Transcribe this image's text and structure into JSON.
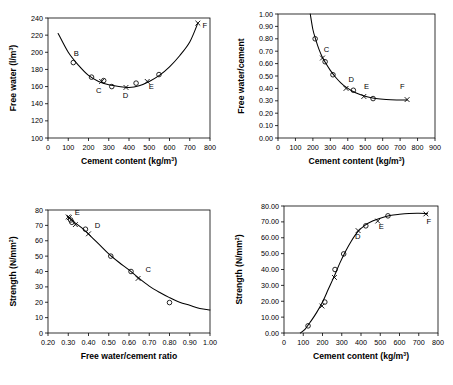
{
  "figure": {
    "panel_count": 4,
    "background": "#ffffff",
    "ink": "#000000"
  },
  "chart_data": [
    {
      "id": "panel-top-left",
      "type": "scatter",
      "title": "",
      "xlabel": "Cement content (kg/m3)",
      "xlabel_base": "Cement content (kg/m",
      "xlabel_sup": "3",
      "xlabel_tail": ")",
      "ylabel": "Free water (l/m3)",
      "ylabel_base": "Free water (l/m",
      "ylabel_sup": "3",
      "ylabel_tail": ")",
      "xlim": [
        0,
        800
      ],
      "ylim": [
        100,
        240
      ],
      "xticks": [
        0,
        100,
        200,
        300,
        400,
        500,
        600,
        700,
        800
      ],
      "xtick_labels": [
        "0",
        "100",
        "200",
        "300",
        "400",
        "500",
        "600",
        "700",
        "800"
      ],
      "yticks": [
        100,
        120,
        140,
        160,
        180,
        200,
        220,
        240
      ],
      "ytick_labels": [
        "100",
        "120",
        "140",
        "160",
        "180",
        "200",
        "220",
        "240"
      ],
      "grid": false,
      "legend": "none",
      "series": [
        {
          "name": "measured",
          "marker": "circle",
          "points": [
            {
              "x": 125,
              "y": 188
            },
            {
              "x": 215,
              "y": 171
            },
            {
              "x": 275,
              "y": 167
            },
            {
              "x": 315,
              "y": 160
            },
            {
              "x": 435,
              "y": 164
            },
            {
              "x": 548,
              "y": 174
            }
          ]
        },
        {
          "name": "design",
          "marker": "cross",
          "points": [
            {
              "x": 265,
              "y": 166
            },
            {
              "x": 385,
              "y": 159
            },
            {
              "x": 490,
              "y": 166
            },
            {
              "x": 740,
              "y": 234
            }
          ]
        }
      ],
      "fit_curve": [
        {
          "x": 50,
          "y": 222
        },
        {
          "x": 100,
          "y": 200
        },
        {
          "x": 150,
          "y": 185
        },
        {
          "x": 200,
          "y": 173
        },
        {
          "x": 250,
          "y": 166
        },
        {
          "x": 300,
          "y": 162
        },
        {
          "x": 350,
          "y": 160
        },
        {
          "x": 400,
          "y": 159
        },
        {
          "x": 450,
          "y": 161
        },
        {
          "x": 500,
          "y": 166
        },
        {
          "x": 550,
          "y": 173
        },
        {
          "x": 600,
          "y": 183
        },
        {
          "x": 650,
          "y": 196
        },
        {
          "x": 700,
          "y": 212
        },
        {
          "x": 740,
          "y": 234
        }
      ],
      "annotations": [
        {
          "text": "B",
          "x": 140,
          "y": 196
        },
        {
          "text": "C",
          "x": 250,
          "y": 152
        },
        {
          "text": "D",
          "x": 383,
          "y": 147
        },
        {
          "text": "E",
          "x": 510,
          "y": 157
        },
        {
          "text": "F",
          "x": 775,
          "y": 228
        }
      ]
    },
    {
      "id": "panel-top-right",
      "type": "scatter",
      "title": "",
      "xlabel": "Cement content (kg/m3)",
      "xlabel_base": "Cement content (kg/m",
      "xlabel_sup": "3",
      "xlabel_tail": ")",
      "ylabel": "Free water/cement",
      "xlim": [
        0,
        900
      ],
      "ylim": [
        0.0,
        1.0
      ],
      "xticks": [
        0,
        100,
        200,
        300,
        400,
        500,
        600,
        700,
        800,
        900
      ],
      "xtick_labels": [
        "0",
        "100",
        "200",
        "300",
        "400",
        "500",
        "600",
        "700",
        "800",
        "900"
      ],
      "yticks": [
        0.0,
        0.1,
        0.2,
        0.3,
        0.4,
        0.5,
        0.6,
        0.7,
        0.8,
        0.9,
        1.0
      ],
      "ytick_labels": [
        "0.00",
        "0.10",
        "0.20",
        "0.30",
        "0.40",
        "0.50",
        "0.60",
        "0.70",
        "0.80",
        "0.90",
        "1.00"
      ],
      "grid": false,
      "legend": "none",
      "series": [
        {
          "name": "measured",
          "marker": "circle",
          "points": [
            {
              "x": 213,
              "y": 0.8
            },
            {
              "x": 270,
              "y": 0.615
            },
            {
              "x": 315,
              "y": 0.51
            },
            {
              "x": 432,
              "y": 0.385
            },
            {
              "x": 545,
              "y": 0.318
            }
          ]
        },
        {
          "name": "design",
          "marker": "cross",
          "points": [
            {
              "x": 255,
              "y": 0.645
            },
            {
              "x": 390,
              "y": 0.4
            },
            {
              "x": 492,
              "y": 0.335
            },
            {
              "x": 740,
              "y": 0.31
            }
          ]
        }
      ],
      "fit_curve": [
        {
          "x": 185,
          "y": 1.0
        },
        {
          "x": 200,
          "y": 0.875
        },
        {
          "x": 215,
          "y": 0.8
        },
        {
          "x": 235,
          "y": 0.715
        },
        {
          "x": 255,
          "y": 0.65
        },
        {
          "x": 275,
          "y": 0.6
        },
        {
          "x": 300,
          "y": 0.545
        },
        {
          "x": 330,
          "y": 0.49
        },
        {
          "x": 360,
          "y": 0.445
        },
        {
          "x": 390,
          "y": 0.41
        },
        {
          "x": 430,
          "y": 0.375
        },
        {
          "x": 470,
          "y": 0.35
        },
        {
          "x": 510,
          "y": 0.332
        },
        {
          "x": 560,
          "y": 0.318
        },
        {
          "x": 620,
          "y": 0.31
        },
        {
          "x": 680,
          "y": 0.307
        },
        {
          "x": 740,
          "y": 0.307
        }
      ],
      "annotations": [
        {
          "text": "C",
          "x": 278,
          "y": 0.695
        },
        {
          "text": "D",
          "x": 420,
          "y": 0.452
        },
        {
          "text": "E",
          "x": 508,
          "y": 0.392
        },
        {
          "text": "F",
          "x": 712,
          "y": 0.392
        }
      ]
    },
    {
      "id": "panel-bottom-left",
      "type": "scatter",
      "title": "",
      "xlabel": "Free water/cement ratio",
      "ylabel": "Strength (N/mm2)",
      "ylabel_base": "Strength  (N/mm",
      "ylabel_sup": "2",
      "ylabel_tail": ")",
      "xlim": [
        0.2,
        1.0
      ],
      "ylim": [
        0,
        80
      ],
      "xticks": [
        0.2,
        0.3,
        0.4,
        0.5,
        0.6,
        0.7,
        0.8,
        0.9,
        1.0
      ],
      "xtick_labels": [
        "0.20",
        "0.30",
        "0.40",
        "0.50",
        "0.60",
        "0.70",
        "0.80",
        "0.90",
        "1.00"
      ],
      "yticks": [
        0,
        10,
        20,
        30,
        40,
        50,
        60,
        70,
        80
      ],
      "ytick_labels": [
        "0",
        "10",
        "20",
        "30",
        "40",
        "50",
        "60",
        "70",
        "80"
      ],
      "grid": false,
      "legend": "none",
      "series": [
        {
          "name": "measured",
          "marker": "circle",
          "points": [
            {
              "x": 0.312,
              "y": 73.5
            },
            {
              "x": 0.318,
              "y": 72.0
            },
            {
              "x": 0.385,
              "y": 67.5
            },
            {
              "x": 0.51,
              "y": 50.0
            },
            {
              "x": 0.61,
              "y": 40.0
            },
            {
              "x": 0.8,
              "y": 19.8
            }
          ]
        },
        {
          "name": "design",
          "marker": "cross",
          "points": [
            {
              "x": 0.3,
              "y": 75.5
            },
            {
              "x": 0.305,
              "y": 75.0
            },
            {
              "x": 0.335,
              "y": 70.5
            },
            {
              "x": 0.4,
              "y": 64.5
            },
            {
              "x": 0.645,
              "y": 35.5
            }
          ]
        }
      ],
      "fit_curve": [
        {
          "x": 0.295,
          "y": 76.0
        },
        {
          "x": 0.33,
          "y": 72.0
        },
        {
          "x": 0.37,
          "y": 68.0
        },
        {
          "x": 0.41,
          "y": 63.0
        },
        {
          "x": 0.45,
          "y": 58.0
        },
        {
          "x": 0.5,
          "y": 51.5
        },
        {
          "x": 0.55,
          "y": 46.0
        },
        {
          "x": 0.6,
          "y": 41.0
        },
        {
          "x": 0.65,
          "y": 35.5
        },
        {
          "x": 0.7,
          "y": 30.5
        },
        {
          "x": 0.75,
          "y": 26.5
        },
        {
          "x": 0.8,
          "y": 23.0
        },
        {
          "x": 0.85,
          "y": 20.0
        },
        {
          "x": 0.9,
          "y": 18.0
        },
        {
          "x": 0.95,
          "y": 16.0
        },
        {
          "x": 1.0,
          "y": 15.0
        }
      ],
      "annotations": [
        {
          "text": "E",
          "x": 0.345,
          "y": 76.5
        },
        {
          "text": "D",
          "x": 0.445,
          "y": 68.5
        },
        {
          "text": "C",
          "x": 0.695,
          "y": 39.5
        }
      ]
    },
    {
      "id": "panel-bottom-right",
      "type": "scatter",
      "title": "",
      "xlabel": "Cement content (kg/m3)",
      "xlabel_base": "Cement content (kg/m",
      "xlabel_sup": "3",
      "xlabel_tail": ")",
      "ylabel": "Strength (N/mm2)",
      "ylabel_base": "Strength  (N/mm",
      "ylabel_sup": "2",
      "ylabel_tail": ")",
      "xlim": [
        0,
        800
      ],
      "ylim": [
        0,
        80
      ],
      "xticks": [
        0,
        100,
        200,
        300,
        400,
        500,
        600,
        700,
        800
      ],
      "xtick_labels": [
        "0",
        "100",
        "200",
        "300",
        "400",
        "500",
        "600",
        "700",
        "800"
      ],
      "yticks": [
        0,
        10,
        20,
        30,
        40,
        50,
        60,
        70,
        80
      ],
      "ytick_labels": [
        "0.00",
        "10.00",
        "20.00",
        "30.00",
        "40.00",
        "50.00",
        "60.00",
        "70.00",
        "80.00"
      ],
      "grid": false,
      "legend": "none",
      "series": [
        {
          "name": "measured",
          "marker": "circle",
          "points": [
            {
              "x": 125,
              "y": 4.5
            },
            {
              "x": 212,
              "y": 19.5
            },
            {
              "x": 265,
              "y": 40.0
            },
            {
              "x": 310,
              "y": 49.8
            },
            {
              "x": 425,
              "y": 67.5
            },
            {
              "x": 540,
              "y": 73.8
            }
          ]
        },
        {
          "name": "design",
          "marker": "cross",
          "points": [
            {
              "x": 197,
              "y": 17.0
            },
            {
              "x": 262,
              "y": 35.0
            },
            {
              "x": 385,
              "y": 64.5
            },
            {
              "x": 487,
              "y": 70.5
            },
            {
              "x": 737,
              "y": 75.0
            }
          ]
        }
      ],
      "fit_curve": [
        {
          "x": 85,
          "y": 0
        },
        {
          "x": 110,
          "y": 2.5
        },
        {
          "x": 140,
          "y": 7.5
        },
        {
          "x": 170,
          "y": 13.0
        },
        {
          "x": 200,
          "y": 19.5
        },
        {
          "x": 230,
          "y": 27.5
        },
        {
          "x": 260,
          "y": 35.5
        },
        {
          "x": 290,
          "y": 44.0
        },
        {
          "x": 320,
          "y": 51.5
        },
        {
          "x": 350,
          "y": 58.0
        },
        {
          "x": 385,
          "y": 64.0
        },
        {
          "x": 420,
          "y": 67.8
        },
        {
          "x": 460,
          "y": 70.5
        },
        {
          "x": 500,
          "y": 72.3
        },
        {
          "x": 550,
          "y": 74.0
        },
        {
          "x": 600,
          "y": 74.8
        },
        {
          "x": 650,
          "y": 75.3
        },
        {
          "x": 700,
          "y": 75.4
        },
        {
          "x": 745,
          "y": 75.2
        }
      ],
      "annotations": [
        {
          "text": "D",
          "x": 383,
          "y": 59.0
        },
        {
          "text": "E",
          "x": 505,
          "y": 65.5
        },
        {
          "text": "F",
          "x": 752,
          "y": 68.5
        }
      ]
    }
  ]
}
